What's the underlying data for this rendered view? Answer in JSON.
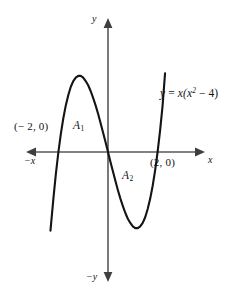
{
  "figure": {
    "background_color": "#ffffff",
    "curve_color": "#141414",
    "axis_color": "#58585a"
  },
  "axes": {
    "y_positive_label": "y",
    "y_negative_label": "−y",
    "x_negative_label": "−x",
    "x_positive_label": "x",
    "origin": {
      "x": 108,
      "y": 152
    },
    "x_axis_extent": {
      "start": 26,
      "end": 205
    },
    "y_axis_extent": {
      "start": 18,
      "end": 282
    },
    "units_per_pixel": 24.8
  },
  "annotations": {
    "point_left": "(− 2, 0)",
    "point_right": "(2, 0)",
    "area_1_label": "A",
    "area_1_subscript": "1",
    "area_2_label": "A",
    "area_2_subscript": "2",
    "equation_lhs": "y",
    "equation_eq": "=",
    "equation_rhs_pre": "x(x",
    "equation_exponent": "2",
    "equation_rhs_post": " − 4)"
  },
  "chart_data": {
    "type": "line",
    "title": "",
    "xlabel": "x",
    "ylabel": "y",
    "function": "y = x(x^2 - 4)",
    "roots": [
      -2,
      0,
      2
    ],
    "labeled_points": [
      {
        "label": "(− 2, 0)",
        "x": -2,
        "y": 0
      },
      {
        "label": "(2, 0)",
        "x": 2,
        "y": 0
      }
    ],
    "local_maximum": {
      "x": -1.1547,
      "y": 3.0792
    },
    "local_minimum": {
      "x": 1.1547,
      "y": -3.0792
    },
    "regions": [
      {
        "name": "A1",
        "x_range": [
          -2,
          0
        ],
        "description": "area above x-axis between x = -2 and x = 0"
      },
      {
        "name": "A2",
        "x_range": [
          0,
          2
        ],
        "description": "area below x-axis between x = 0 and x = 2"
      }
    ],
    "x": [
      -2.32,
      -2.2,
      -2.1,
      -2.0,
      -1.9,
      -1.8,
      -1.7,
      -1.6,
      -1.5,
      -1.4,
      -1.3,
      -1.2,
      -1.1,
      -1.0,
      -0.9,
      -0.8,
      -0.7,
      -0.6,
      -0.5,
      -0.4,
      -0.3,
      -0.2,
      -0.1,
      0.0,
      0.1,
      0.2,
      0.3,
      0.4,
      0.5,
      0.6,
      0.7,
      0.8,
      0.9,
      1.0,
      1.1,
      1.2,
      1.3,
      1.4,
      1.5,
      1.6,
      1.7,
      1.8,
      1.9,
      2.0,
      2.1,
      2.2,
      2.3
    ],
    "y": [
      -3.17,
      -1.86,
      -0.86,
      0.0,
      0.74,
      1.37,
      1.89,
      2.3,
      2.63,
      2.86,
      3.0,
      3.07,
      3.07,
      3.0,
      2.86,
      2.69,
      2.46,
      2.18,
      1.88,
      1.54,
      1.17,
      0.79,
      0.4,
      0.0,
      -0.4,
      -0.79,
      -1.17,
      -1.54,
      -1.88,
      -2.18,
      -2.46,
      -2.69,
      -2.86,
      -3.0,
      -3.07,
      -3.07,
      -3.0,
      -2.86,
      -2.63,
      -2.3,
      -1.89,
      -1.37,
      -0.74,
      0.0,
      0.86,
      1.86,
      3.17
    ],
    "xlim": [
      -3.3,
      3.9
    ],
    "ylim": [
      -5.4,
      5.4
    ],
    "grid": false,
    "legend": false,
    "annotations": [
      "y = x(x² − 4)",
      "A₁",
      "A₂",
      "(− 2, 0)",
      "(2, 0)"
    ]
  }
}
